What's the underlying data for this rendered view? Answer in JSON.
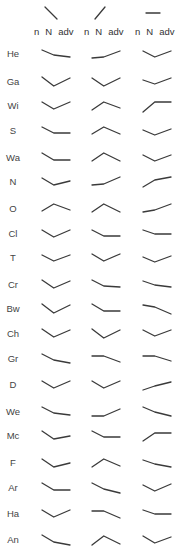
{
  "chart_data": {
    "type": "line",
    "title": "",
    "point_labels": [
      "n",
      "N",
      "adv"
    ],
    "column_headers": [
      {
        "reference_glyph": "falling",
        "labels": [
          "n",
          "N",
          "adv"
        ]
      },
      {
        "reference_glyph": "rising",
        "labels": [
          "n",
          "N",
          "adv"
        ]
      },
      {
        "reference_glyph": "flat",
        "labels": [
          "n",
          "N",
          "adv"
        ]
      }
    ],
    "rows": [
      {
        "label": "He",
        "glyphs": [
          [
            2,
            7,
            9
          ],
          [
            10,
            9,
            3
          ],
          [
            3,
            9,
            3
          ]
        ]
      },
      {
        "label": "Ga",
        "glyphs": [
          [
            1,
            10,
            2
          ],
          [
            2,
            10,
            2
          ],
          [
            4,
            8,
            2
          ]
        ]
      },
      {
        "label": "Wi",
        "glyphs": [
          [
            2,
            9,
            2
          ],
          [
            10,
            2,
            8
          ],
          [
            12,
            2,
            2
          ]
        ]
      },
      {
        "label": "S",
        "glyphs": [
          [
            2,
            8,
            8
          ],
          [
            9,
            2,
            9
          ],
          [
            5,
            10,
            4
          ]
        ]
      },
      {
        "label": "Wa",
        "glyphs": [
          [
            1,
            8,
            8
          ],
          [
            9,
            1,
            9
          ],
          [
            3,
            9,
            3
          ]
        ]
      },
      {
        "label": "N",
        "glyphs": [
          [
            2,
            9,
            5
          ],
          [
            9,
            8,
            1
          ],
          [
            11,
            4,
            1
          ]
        ]
      },
      {
        "label": "O",
        "glyphs": [
          [
            8,
            1,
            7
          ],
          [
            9,
            1,
            9
          ],
          [
            9,
            7,
            1
          ]
        ]
      },
      {
        "label": "Cl",
        "glyphs": [
          [
            2,
            9,
            2
          ],
          [
            2,
            8,
            8
          ],
          [
            2,
            6,
            6
          ]
        ]
      },
      {
        "label": "T",
        "glyphs": [
          [
            3,
            9,
            3
          ],
          [
            2,
            9,
            2
          ],
          [
            5,
            10,
            4
          ]
        ]
      },
      {
        "label": "Cr",
        "glyphs": [
          [
            1,
            9,
            2
          ],
          [
            1,
            7,
            8
          ],
          [
            2,
            6,
            8
          ]
        ]
      },
      {
        "label": "Bw",
        "glyphs": [
          [
            1,
            10,
            2
          ],
          [
            1,
            8,
            8
          ],
          [
            2,
            4,
            11
          ]
        ]
      },
      {
        "label": "Ch",
        "glyphs": [
          [
            1,
            9,
            2
          ],
          [
            1,
            10,
            2
          ],
          [
            2,
            8,
            2
          ]
        ]
      },
      {
        "label": "Gr",
        "glyphs": [
          [
            1,
            7,
            10
          ],
          [
            3,
            3,
            9
          ],
          [
            3,
            3,
            8
          ]
        ]
      },
      {
        "label": "D",
        "glyphs": [
          [
            2,
            9,
            2
          ],
          [
            2,
            9,
            2
          ],
          [
            11,
            7,
            3
          ]
        ]
      },
      {
        "label": "We",
        "glyphs": [
          [
            1,
            7,
            9
          ],
          [
            10,
            10,
            3
          ],
          [
            1,
            6,
            10
          ]
        ]
      },
      {
        "label": "Mc",
        "glyphs": [
          [
            1,
            9,
            6
          ],
          [
            1,
            7,
            7
          ],
          [
            11,
            3,
            3
          ]
        ]
      },
      {
        "label": "F",
        "glyphs": [
          [
            2,
            10,
            6
          ],
          [
            10,
            2,
            9
          ],
          [
            3,
            7,
            10
          ]
        ]
      },
      {
        "label": "Ar",
        "glyphs": [
          [
            1,
            8,
            8
          ],
          [
            1,
            7,
            11
          ],
          [
            3,
            9,
            2
          ]
        ]
      },
      {
        "label": "Ha",
        "glyphs": [
          [
            2,
            9,
            2
          ],
          [
            3,
            3,
            10
          ],
          [
            2,
            6,
            6
          ]
        ]
      },
      {
        "label": "An",
        "glyphs": [
          [
            1,
            8,
            11
          ],
          [
            11,
            2,
            10
          ],
          [
            2,
            9,
            3
          ]
        ]
      }
    ]
  }
}
